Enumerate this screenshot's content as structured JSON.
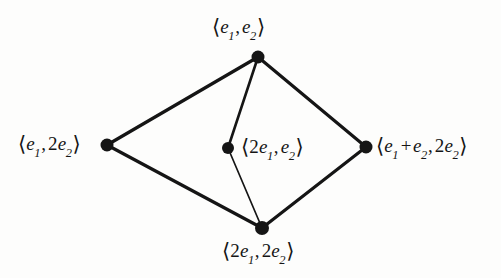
{
  "figure": {
    "type": "lattice-diagram",
    "background_color": "#fdfdfc",
    "ink_color": "#151515"
  },
  "nodes": [
    {
      "id": "top",
      "name": "node-e1-e2",
      "x": 258,
      "y": 57,
      "radius": 6.5,
      "label_text": "⟨e1, e2⟩",
      "label_position": "above",
      "parts": {
        "open": "⟨",
        "first_coeff": "",
        "first_sym": "e",
        "first_sub": "1",
        "comma": ",",
        "second_coeff": "",
        "second_sym": "e",
        "second_sub": "2",
        "close": "⟩"
      }
    },
    {
      "id": "left",
      "name": "node-e1-2e2",
      "x": 107,
      "y": 145,
      "radius": 6.5,
      "label_text": "⟨e1, 2e2⟩",
      "label_position": "left",
      "parts": {
        "open": "⟨",
        "first_coeff": "",
        "first_sym": "e",
        "first_sub": "1",
        "comma": ",",
        "second_coeff": "2",
        "second_sym": "e",
        "second_sub": "2",
        "close": "⟩"
      }
    },
    {
      "id": "center",
      "name": "node-2e1-e2",
      "x": 228,
      "y": 148,
      "radius": 6.0,
      "label_text": "⟨2e1, e2⟩",
      "label_position": "right",
      "parts": {
        "open": "⟨",
        "first_coeff": "2",
        "first_sym": "e",
        "first_sub": "1",
        "comma": ",",
        "second_coeff": "",
        "second_sym": "e",
        "second_sub": "2",
        "close": "⟩"
      }
    },
    {
      "id": "right",
      "name": "node-e1-plus-e2-2e2",
      "x": 366,
      "y": 147,
      "radius": 6.5,
      "label_text": "⟨e1 + e2, 2e2⟩",
      "label_position": "right",
      "parts": {
        "open": "⟨",
        "first_coeff": "",
        "first_sym": "e",
        "first_sub": "1",
        "plus": "+",
        "second_sym": "e",
        "second_sub": "2",
        "comma": ",",
        "third_coeff": "2",
        "third_sym": "e",
        "third_sub": "2",
        "close": "⟩"
      }
    },
    {
      "id": "bottom",
      "name": "node-2e1-2e2",
      "x": 262,
      "y": 228,
      "radius": 7.0,
      "label_text": "⟨2e1, 2e2⟩",
      "label_position": "below",
      "parts": {
        "open": "⟨",
        "first_coeff": "2",
        "first_sym": "e",
        "first_sub": "1",
        "comma": ",",
        "second_coeff": "2",
        "second_sym": "e",
        "second_sub": "2",
        "close": "⟩"
      }
    }
  ],
  "edges": [
    {
      "name": "edge-left-to-top",
      "from": "left",
      "to": "top",
      "width": 3.2
    },
    {
      "name": "edge-top-to-right",
      "from": "top",
      "to": "right",
      "width": 3.2
    },
    {
      "name": "edge-left-to-bottom",
      "from": "left",
      "to": "bottom",
      "width": 3.2
    },
    {
      "name": "edge-bottom-to-right",
      "from": "bottom",
      "to": "right",
      "width": 3.2
    },
    {
      "name": "edge-top-to-center",
      "from": "top",
      "to": "center",
      "width": 2.6
    },
    {
      "name": "edge-center-to-bottom",
      "from": "center",
      "to": "bottom",
      "width": 1.7
    }
  ]
}
